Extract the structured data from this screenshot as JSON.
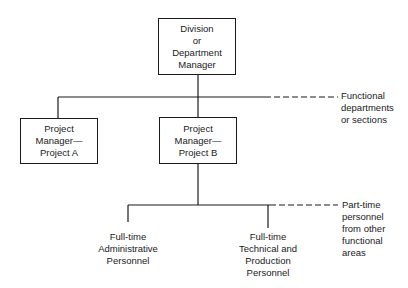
{
  "diagram": {
    "type": "org-chart",
    "nodes": {
      "division_manager": {
        "lines": [
          "Division",
          "or",
          "Department",
          "Manager"
        ]
      },
      "project_a": {
        "lines": [
          "Project",
          "Manager—",
          "Project A"
        ]
      },
      "project_b": {
        "lines": [
          "Project",
          "Manager—",
          "Project B"
        ]
      },
      "admin_personnel": {
        "lines": [
          "Full-time",
          "Administrative",
          "Personnel"
        ]
      },
      "tech_personnel": {
        "lines": [
          "Full-time",
          "Technical and",
          "Production",
          "Personnel"
        ]
      }
    },
    "annotations": {
      "functional_departments": {
        "lines": [
          "Functional",
          "departments",
          "or sections"
        ]
      },
      "part_time": {
        "lines": [
          "Part-time",
          "personnel",
          "from other",
          "functional",
          "areas"
        ]
      }
    },
    "edges": [
      {
        "from": "division_manager",
        "to": "project_a"
      },
      {
        "from": "division_manager",
        "to": "project_b"
      },
      {
        "from": "project_b",
        "to": "admin_personnel"
      },
      {
        "from": "project_b",
        "to": "tech_personnel"
      }
    ],
    "colors": {
      "ink": "#1a1a1a",
      "background": "#ffffff"
    }
  }
}
